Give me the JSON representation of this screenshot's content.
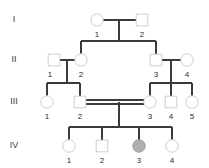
{
  "diagram": {
    "type": "pedigree-chart",
    "colors": {
      "line": "#3b3b3b",
      "symbol_stroke": "#cfcfcf",
      "symbol_fill": "#ffffff",
      "affected_fill": "#b0b0b0",
      "text": "#2b2b2b",
      "background": "#ffffff"
    },
    "legend_note": "double horizontal line = consanguineous mating; shaded symbol = affected"
  },
  "generations": [
    {
      "label": "I",
      "label_x": 14,
      "label_y": 20,
      "row_y": 20,
      "individuals": [
        {
          "id": "1",
          "sex": "female",
          "shape": "circle",
          "affected": false,
          "x": 97,
          "y": 20,
          "label_x": 97,
          "label_y": 35
        },
        {
          "id": "2",
          "sex": "male",
          "shape": "square",
          "affected": false,
          "x": 142,
          "y": 20,
          "label_x": 142,
          "label_y": 35
        }
      ]
    },
    {
      "label": "II",
      "label_x": 14,
      "label_y": 60,
      "row_y": 60,
      "individuals": [
        {
          "id": "1",
          "sex": "male",
          "shape": "square",
          "affected": false,
          "x": 54,
          "y": 60,
          "label_x": 50,
          "label_y": 75
        },
        {
          "id": "2",
          "sex": "female",
          "shape": "circle",
          "affected": false,
          "x": 81,
          "y": 60,
          "label_x": 81,
          "label_y": 75
        },
        {
          "id": "3",
          "sex": "male",
          "shape": "square",
          "affected": false,
          "x": 156,
          "y": 60,
          "label_x": 156,
          "label_y": 75
        },
        {
          "id": "4",
          "sex": "female",
          "shape": "circle",
          "affected": false,
          "x": 187,
          "y": 60,
          "label_x": 187,
          "label_y": 75
        }
      ]
    },
    {
      "label": "III",
      "label_x": 14,
      "label_y": 102,
      "row_y": 102,
      "individuals": [
        {
          "id": "1",
          "sex": "female",
          "shape": "circle",
          "affected": false,
          "x": 47,
          "y": 102,
          "label_x": 47,
          "label_y": 117
        },
        {
          "id": "2",
          "sex": "male",
          "shape": "square",
          "affected": false,
          "x": 80,
          "y": 102,
          "label_x": 80,
          "label_y": 117
        },
        {
          "id": "3",
          "sex": "female",
          "shape": "circle",
          "affected": false,
          "x": 150,
          "y": 102,
          "label_x": 150,
          "label_y": 117
        },
        {
          "id": "4",
          "sex": "male",
          "shape": "square",
          "affected": false,
          "x": 171,
          "y": 102,
          "label_x": 171,
          "label_y": 117
        },
        {
          "id": "5",
          "sex": "female",
          "shape": "circle",
          "affected": false,
          "x": 192,
          "y": 102,
          "label_x": 192,
          "label_y": 117
        }
      ]
    },
    {
      "label": "IV",
      "label_x": 14,
      "label_y": 146,
      "row_y": 146,
      "individuals": [
        {
          "id": "1",
          "sex": "female",
          "shape": "circle",
          "affected": false,
          "x": 69,
          "y": 146,
          "label_x": 69,
          "label_y": 161
        },
        {
          "id": "2",
          "sex": "male",
          "shape": "square",
          "affected": false,
          "x": 102,
          "y": 146,
          "label_x": 102,
          "label_y": 161
        },
        {
          "id": "3",
          "sex": "female",
          "shape": "circle",
          "affected": true,
          "x": 139,
          "y": 146,
          "label_x": 139,
          "label_y": 161
        },
        {
          "id": "4",
          "sex": "female",
          "shape": "circle",
          "affected": false,
          "x": 172,
          "y": 146,
          "label_x": 172,
          "label_y": 161
        }
      ]
    }
  ],
  "matings": [
    {
      "name": "mating-I1-I2",
      "kind": "normal",
      "x1": 103,
      "x2": 136,
      "y": 20,
      "drop_x": 119,
      "drop_y1": 20,
      "drop_y2": 41
    },
    {
      "name": "mating-II1-II2",
      "kind": "normal",
      "x1": 60,
      "x2": 75,
      "y": 60,
      "drop_x": 67,
      "drop_y1": 60,
      "drop_y2": 83
    },
    {
      "name": "mating-II3-II4",
      "kind": "normal",
      "x1": 162,
      "x2": 181,
      "y": 60,
      "drop_x": 171,
      "drop_y1": 60,
      "drop_y2": 83
    },
    {
      "name": "mating-III2-III3",
      "kind": "consanguineous",
      "x1": 86,
      "x2": 144,
      "y": 100,
      "y_second": 104,
      "drop_x": 119,
      "drop_y1": 102,
      "drop_y2": 127
    }
  ],
  "sibships": [
    {
      "name": "sibship-generation-II",
      "bar_y": 41,
      "x1": 81,
      "x2": 156,
      "drops": [
        {
          "x": 81,
          "y2": 54
        },
        {
          "x": 156,
          "y2": 54
        }
      ]
    },
    {
      "name": "sibship-III-left",
      "bar_y": 83,
      "x1": 47,
      "x2": 80,
      "drops": [
        {
          "x": 47,
          "y2": 96
        },
        {
          "x": 80,
          "y2": 96
        }
      ]
    },
    {
      "name": "sibship-III-right",
      "bar_y": 83,
      "x1": 150,
      "x2": 192,
      "drops": [
        {
          "x": 150,
          "y2": 96
        },
        {
          "x": 171,
          "y2": 96
        },
        {
          "x": 192,
          "y2": 96
        }
      ]
    },
    {
      "name": "sibship-generation-IV",
      "bar_y": 127,
      "x1": 69,
      "x2": 172,
      "drops": [
        {
          "x": 69,
          "y2": 140
        },
        {
          "x": 102,
          "y2": 140
        },
        {
          "x": 139,
          "y2": 140
        },
        {
          "x": 172,
          "y2": 140
        }
      ]
    }
  ]
}
